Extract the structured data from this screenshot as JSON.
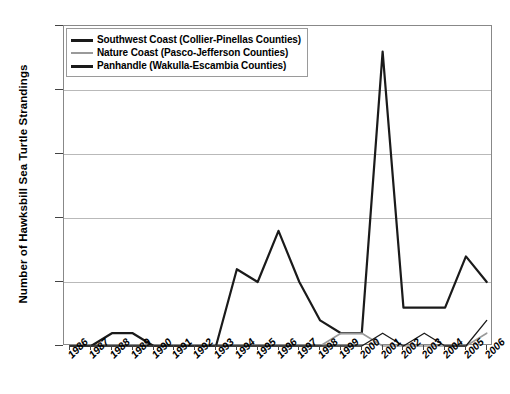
{
  "chart_data": {
    "type": "line",
    "title": "",
    "xlabel": "",
    "ylabel": "Number of Hawksbill Sea Turtle Strandings",
    "x": [
      1986,
      1987,
      1988,
      1989,
      1990,
      1991,
      1992,
      1993,
      1994,
      1995,
      1996,
      1997,
      1998,
      1999,
      2000,
      2001,
      2002,
      2003,
      2004,
      2005,
      2006
    ],
    "xtick_labels": [
      "1986",
      "1987",
      "1988",
      "1989",
      "1990",
      "1991",
      "1992",
      "1993",
      "1994",
      "1995",
      "1996",
      "1997",
      "1998",
      "1999",
      "2000",
      "2001",
      "2002",
      "2003",
      "2004",
      "2005",
      "2006"
    ],
    "ylim": [
      0,
      25
    ],
    "yticks": [
      0,
      5,
      10,
      15,
      20,
      25
    ],
    "ytick_labels": [
      "0",
      "5",
      "10",
      "15",
      "20",
      "25"
    ],
    "grid": true,
    "legend_position": "top-left",
    "series": [
      {
        "name": "Southwest Coast (Collier-Pinellas Counties)",
        "color": "#1a1a1a",
        "width": 2.2,
        "values": [
          0,
          0,
          1,
          1,
          0,
          0,
          0,
          0,
          6,
          5,
          9,
          5,
          2,
          1,
          1,
          23,
          3,
          3,
          3,
          7,
          5
        ]
      },
      {
        "name": "Nature Coast (Pasco-Jefferson Counties)",
        "color": "#9a9a9a",
        "width": 1.6,
        "values": [
          0,
          0,
          0,
          0,
          0,
          0,
          0,
          0,
          0,
          0,
          0,
          0,
          0,
          1,
          1,
          0,
          0,
          0,
          0,
          0,
          1
        ]
      },
      {
        "name": "Panhandle (Wakulla-Escambia Counties)",
        "color": "#1a1a1a",
        "width": 1.3,
        "values": [
          0,
          0,
          0,
          0,
          0,
          0,
          0,
          0,
          0,
          0,
          0,
          0,
          0,
          0,
          0,
          1,
          0,
          1,
          0,
          0,
          2
        ]
      }
    ]
  },
  "legend": {
    "entries": [
      {
        "label": "Southwest Coast (Collier-Pinellas Counties)"
      },
      {
        "label": "Nature Coast (Pasco-Jefferson Counties)"
      },
      {
        "label": "Panhandle (Wakulla-Escambia Counties)"
      }
    ]
  }
}
